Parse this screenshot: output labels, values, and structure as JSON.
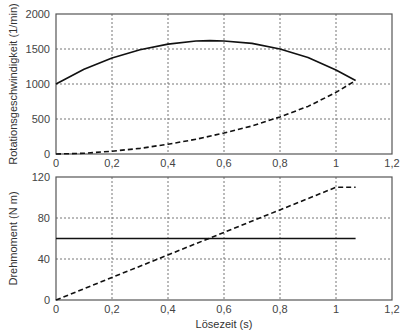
{
  "chart_data": [
    {
      "type": "line",
      "title": "",
      "xlabel": "",
      "ylabel": "Rotationsgeschwindigkeit (1/min)",
      "xlim": [
        0,
        1.2
      ],
      "ylim": [
        0,
        2000
      ],
      "xticks": [
        "0",
        "0,2",
        "0,4",
        "0,6",
        "0,8",
        "1",
        "1,2"
      ],
      "yticks": [
        "0",
        "500",
        "1000",
        "1500",
        "2000"
      ],
      "grid": true,
      "series": [
        {
          "name": "solid",
          "style": "solid",
          "x": [
            0,
            0.1,
            0.2,
            0.3,
            0.4,
            0.5,
            0.55,
            0.6,
            0.7,
            0.8,
            0.9,
            1.0,
            1.07
          ],
          "y": [
            1000,
            1210,
            1370,
            1490,
            1570,
            1615,
            1620,
            1615,
            1580,
            1500,
            1380,
            1200,
            1050
          ]
        },
        {
          "name": "dashed",
          "style": "dashed",
          "x": [
            0,
            0.1,
            0.2,
            0.3,
            0.4,
            0.5,
            0.6,
            0.7,
            0.8,
            0.9,
            1.0,
            1.07
          ],
          "y": [
            0,
            10,
            40,
            80,
            140,
            210,
            300,
            400,
            530,
            680,
            880,
            1050
          ]
        }
      ]
    },
    {
      "type": "line",
      "title": "",
      "xlabel": "Lösezeit (s)",
      "ylabel": "Drehmoment (N m)",
      "xlim": [
        0,
        1.2
      ],
      "ylim": [
        0,
        120
      ],
      "xticks": [
        "0",
        "0,2",
        "0,4",
        "0,6",
        "0,8",
        "1",
        "1,2"
      ],
      "yticks": [
        "0",
        "40",
        "80",
        "120"
      ],
      "grid": true,
      "series": [
        {
          "name": "solid",
          "style": "solid",
          "x": [
            0,
            1.07
          ],
          "y": [
            60,
            60
          ]
        },
        {
          "name": "dashed",
          "style": "dashed",
          "x": [
            0,
            1.0,
            1.07
          ],
          "y": [
            0,
            110,
            110
          ]
        }
      ]
    }
  ],
  "layout": {
    "plots": [
      {
        "left": 56,
        "right": 392,
        "top": 14,
        "bottom": 154
      },
      {
        "left": 56,
        "right": 392,
        "top": 177,
        "bottom": 300
      }
    ],
    "line_color": "#111111",
    "grid_color": "#777777",
    "axis_color": "#555555"
  }
}
